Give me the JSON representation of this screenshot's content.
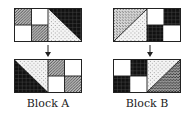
{
  "blocks": [
    {
      "id": "A",
      "label": "Block A",
      "before": {
        "left": "2x2 grid: top-left stipple, top-right white, bottom-left white, bottom-right stipple",
        "right": "diagonal top-left to bottom-right: top-right black, bottom-left light dots"
      },
      "after": {
        "left": "diagonal top-left to bottom-right: bottom-left black, top-right light dots",
        "right": "2x2 grid: top-left stipple, top-right white, bottom-left white, bottom-right stipple"
      }
    },
    {
      "id": "B",
      "label": "Block B",
      "before": {
        "left": "diagonal bottom-left to top-right: top-left dense stipple, bottom-right light dots",
        "right": "2x2 grid: top-left white, top-right black, bottom-left black, bottom-right white"
      },
      "after": {
        "left": "2x2 grid: top-left white, top-right black, bottom-left black, bottom-right white",
        "right": "diagonal bottom-left to top-right: top-left light dots, bottom-right crosshatch"
      }
    }
  ],
  "colors": {
    "border": "#222222",
    "black": "#111111",
    "white": "#ffffff"
  }
}
